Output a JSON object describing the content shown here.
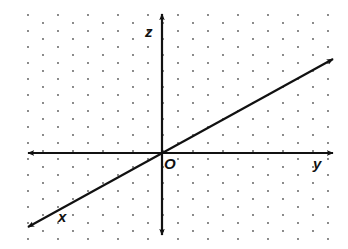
{
  "diagram": {
    "type": "3d-coordinate-axes",
    "background_color": "#ffffff",
    "line_color": "#111111",
    "dot_color": "#555555",
    "origin": {
      "label": "O",
      "x": 162,
      "y": 153
    },
    "axes": [
      {
        "name": "z",
        "label": "z",
        "from": [
          162,
          235
        ],
        "to": [
          162,
          14
        ],
        "arrows": "both",
        "label_pos": [
          145,
          37
        ]
      },
      {
        "name": "y",
        "label": "y",
        "from": [
          28,
          153
        ],
        "to": [
          333,
          153
        ],
        "arrows": "both",
        "label_pos": [
          313,
          169
        ]
      },
      {
        "name": "x",
        "label": "x",
        "from": [
          333,
          59
        ],
        "to": [
          28,
          227
        ],
        "arrows": "both",
        "label_pos": [
          58,
          222
        ]
      }
    ],
    "grid": {
      "style": "staggered-dots",
      "x_start": 28,
      "x_end": 334,
      "col_spacing": 15,
      "y_start": 15,
      "y_end": 244,
      "row_spacing": 16,
      "stagger_offset": 8
    }
  }
}
